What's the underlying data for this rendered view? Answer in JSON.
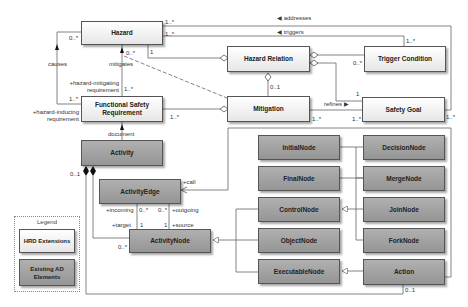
{
  "diagram": {
    "type": "UML class diagram",
    "hrd_classes": {
      "hazard": "Hazard",
      "hazard_relation": "Hazard Relation",
      "trigger_condition": "Trigger Condition",
      "functional_safety_requirement_1": "Functional Safety",
      "functional_safety_requirement_2": "Requirement",
      "mitigation": "Mitigation",
      "safety_goal": "Safety Goal"
    },
    "ad_classes": {
      "activity": "Activity",
      "activity_edge": "ActivityEdge",
      "activity_node": "ActivityNode",
      "initial_node": "InitialNode",
      "final_node": "FinalNode",
      "control_node": "ControlNode",
      "object_node": "ObjectNode",
      "executable_node": "ExecutableNode",
      "decision_node": "DecisionNode",
      "merge_node": "MergeNode",
      "join_node": "JoinNode",
      "fork_node": "ForkNode",
      "action": "Action"
    },
    "associations": {
      "addresses": "◀ addresses",
      "triggers": "◀ triggers",
      "causes": "causes",
      "mitigates": "mitigates",
      "refines": "refines ▶",
      "document": "document"
    },
    "roles": {
      "hazard_mitigating_1": "+hazard-mitigating",
      "hazard_mitigating_2": "requirement",
      "hazard_inducing_1": "+hazard-inducing",
      "hazard_inducing_2": "requirement",
      "call": "+call",
      "incoming": "+incoming",
      "outgoing": "+outgoing",
      "target": "+target",
      "source": "+source"
    },
    "multiplicities": {
      "hazard_addresses": "1..*",
      "hazard_triggers": "1..*",
      "hazard_causes": "0..*",
      "hazard_mitigates": "0..*",
      "hazard_relation_one": "1",
      "fsr_causes": "1..*",
      "fsr_mitigates": "1..*",
      "fsr_hr": "1..*",
      "trigger_top": "1..*",
      "trigger_hr": "0..*",
      "mitigation_hr": "0..1",
      "mitigation_refines": "1..*",
      "safety_goal_refines": "1..*",
      "safety_goal_hr": "1",
      "safety_goal_addresses": "1..*",
      "activity_comp": "0..1",
      "edge_incoming": "0..*",
      "edge_outgoing": "0..*",
      "node_target": "1",
      "node_source": "1",
      "node_comp": "0..*",
      "action_activity": "0..1"
    },
    "legend": {
      "title": "Legend",
      "hrd": "HRD Extensions",
      "existing_1": "Existing AD",
      "existing_2": "Elements"
    }
  }
}
